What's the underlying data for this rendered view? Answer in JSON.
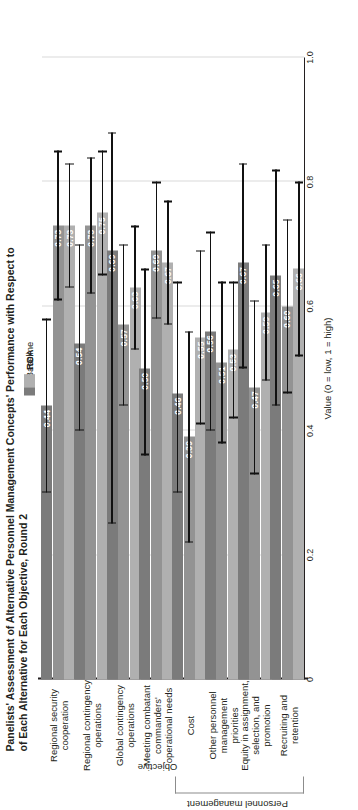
{
  "title": {
    "line1": "Panelists' Assessment of Alternative Personnel Management Concepts' Performance with Respect to",
    "line2": "of Each Alternative for Each Objective, Round 2"
  },
  "legend": [
    {
      "label": "Baseline",
      "color": "#7b7b7b"
    },
    {
      "label": "RDA",
      "color": "#939393"
    },
    {
      "label": "RCA",
      "color": "#b0b0b0"
    }
  ],
  "axis": {
    "value_title": "Value (0 = low, 1 = high)",
    "category_title": "Objective",
    "ticks": [
      "0",
      "0.2",
      "0.4",
      "0.6",
      "0.8",
      "1.0"
    ]
  },
  "group_bracket": {
    "label": "Personnel management"
  },
  "chart_data": {
    "type": "bar",
    "orientation": "horizontal",
    "title": "Panelists' Assessment of Alternative Personnel Management Concepts' Performance with Respect to of Each Alternative for Each Objective, Round 2",
    "xlabel": "Value (0 = low, 1 = high)",
    "ylabel": "Objective",
    "xlim": [
      0,
      1.0
    ],
    "xticks": [
      0,
      0.2,
      0.4,
      0.6,
      0.8,
      1.0
    ],
    "grid": true,
    "legend_position": "top-center",
    "categories": [
      "Regional security cooperation",
      "Regional contingency operations",
      "Global contingency operations",
      "Meeting combatant commanders' operational needs",
      "Cost",
      "Other personnel management priorities",
      "Equity in assignment, selection, and promotion",
      "Recruiting and retention"
    ],
    "series": [
      {
        "name": "Baseline",
        "color": "#7b7b7b",
        "values": [
          0.44,
          0.54,
          0.69,
          0.5,
          0.46,
          0.56,
          0.67,
          0.65
        ],
        "err_low": [
          0.3,
          0.4,
          0.25,
          0.36,
          0.3,
          0.4,
          0.5,
          0.44
        ],
        "err_high": [
          0.58,
          0.7,
          0.88,
          0.66,
          0.64,
          0.72,
          0.83,
          0.82
        ]
      },
      {
        "name": "RDA",
        "color": "#939393",
        "values": [
          0.73,
          0.73,
          0.57,
          0.69,
          0.39,
          0.51,
          0.47,
          0.6
        ],
        "err_low": [
          0.61,
          0.62,
          0.44,
          0.58,
          0.22,
          0.38,
          0.33,
          0.46
        ],
        "err_high": [
          0.85,
          0.84,
          0.7,
          0.8,
          0.56,
          0.64,
          0.61,
          0.74
        ]
      },
      {
        "name": "RCA",
        "color": "#b0b0b0",
        "values": [
          0.73,
          0.75,
          0.63,
          0.67,
          0.55,
          0.53,
          0.59,
          0.66
        ],
        "err_low": [
          0.63,
          0.65,
          0.53,
          0.57,
          0.41,
          0.42,
          0.48,
          0.52
        ],
        "err_high": [
          0.83,
          0.85,
          0.73,
          0.77,
          0.69,
          0.64,
          0.7,
          0.8
        ]
      }
    ],
    "group_brackets": [
      {
        "label": "Personnel management",
        "categories": [
          "Cost",
          "Other personnel management priorities",
          "Equity in assignment, selection, and promotion",
          "Recruiting and retention"
        ]
      }
    ]
  }
}
